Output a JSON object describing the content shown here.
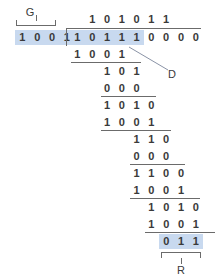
{
  "diagram": {
    "colors": {
      "highlight": "#c8d9ef",
      "ink": "#3a3a3a",
      "rule": "#6b6b6b",
      "background": "#ffffff"
    }
  },
  "labels": {
    "generator": "G",
    "dividend": "D",
    "remainder": "R"
  },
  "divisor": {
    "name": "generator-polynomial",
    "digits": [
      "1",
      "0",
      "0",
      "1"
    ],
    "highlighted": true
  },
  "quotient": {
    "name": "quotient",
    "digits": [
      "1",
      "0",
      "1",
      "0",
      "1",
      "1"
    ],
    "start_col": 1
  },
  "dividend": {
    "name": "message-plus-zeros",
    "digits": [
      "1",
      "0",
      "1",
      "1",
      "1",
      "0",
      "0",
      "0",
      "0"
    ],
    "message_digits": [
      "1",
      "0",
      "1",
      "1",
      "1"
    ],
    "appended_zeros": [
      "0",
      "0",
      "0",
      "0"
    ],
    "highlight_count": 5
  },
  "steps": [
    {
      "digits": [
        "1",
        "0",
        "0",
        "1"
      ],
      "start_col": 0,
      "ruled": true,
      "name": "subtrahend-1"
    },
    {
      "digits": [
        "1",
        "0",
        "1"
      ],
      "start_col": 2,
      "ruled": false,
      "name": "partial-remainder-1"
    },
    {
      "digits": [
        "0",
        "0",
        "0"
      ],
      "start_col": 2,
      "ruled": true,
      "name": "subtrahend-2"
    },
    {
      "digits": [
        "1",
        "0",
        "1",
        "0"
      ],
      "start_col": 2,
      "ruled": false,
      "name": "partial-remainder-2"
    },
    {
      "digits": [
        "1",
        "0",
        "0",
        "1"
      ],
      "start_col": 2,
      "ruled": true,
      "name": "subtrahend-3"
    },
    {
      "digits": [
        "1",
        "1",
        "0"
      ],
      "start_col": 4,
      "ruled": false,
      "name": "partial-remainder-3"
    },
    {
      "digits": [
        "0",
        "0",
        "0"
      ],
      "start_col": 4,
      "ruled": true,
      "name": "subtrahend-4"
    },
    {
      "digits": [
        "1",
        "1",
        "0",
        "0"
      ],
      "start_col": 4,
      "ruled": false,
      "name": "partial-remainder-4"
    },
    {
      "digits": [
        "1",
        "0",
        "0",
        "1"
      ],
      "start_col": 4,
      "ruled": true,
      "name": "subtrahend-5"
    },
    {
      "digits": [
        "1",
        "0",
        "1",
        "0"
      ],
      "start_col": 5,
      "ruled": false,
      "name": "partial-remainder-5"
    },
    {
      "digits": [
        "1",
        "0",
        "0",
        "1"
      ],
      "start_col": 5,
      "ruled": true,
      "name": "subtrahend-6"
    }
  ],
  "remainder": {
    "name": "crc-remainder",
    "digits": [
      "0",
      "1",
      "1"
    ],
    "start_col": 6,
    "highlighted": true
  }
}
